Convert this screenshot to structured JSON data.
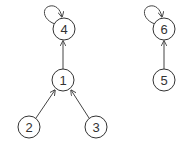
{
  "diagram": {
    "type": "directed-graph",
    "nodes": [
      {
        "id": "1",
        "label": "1",
        "x": 63,
        "y": 80
      },
      {
        "id": "2",
        "label": "2",
        "x": 29,
        "y": 127
      },
      {
        "id": "3",
        "label": "3",
        "x": 96,
        "y": 127
      },
      {
        "id": "4",
        "label": "4",
        "x": 64,
        "y": 29
      },
      {
        "id": "5",
        "label": "5",
        "x": 164,
        "y": 80
      },
      {
        "id": "6",
        "label": "6",
        "x": 164,
        "y": 29
      }
    ],
    "edges": [
      {
        "from": "2",
        "to": "1"
      },
      {
        "from": "3",
        "to": "1"
      },
      {
        "from": "1",
        "to": "4"
      },
      {
        "from": "4",
        "to": "4",
        "self_loop": true
      },
      {
        "from": "5",
        "to": "6"
      },
      {
        "from": "6",
        "to": "6",
        "self_loop": true
      }
    ],
    "colors": {
      "stroke": "#333333",
      "background": "#ffffff"
    }
  }
}
